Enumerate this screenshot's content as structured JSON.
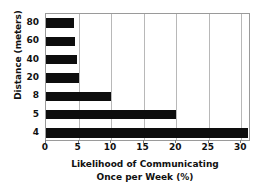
{
  "chart_data": {
    "type": "bar",
    "orientation": "horizontal",
    "title": "",
    "xlabel_line1": "Likelihood of Communicating",
    "xlabel_line2": "Once per Week (%)",
    "ylabel": "Distance (meters)",
    "categories": [
      "80",
      "60",
      "40",
      "20",
      "8",
      "5",
      "4"
    ],
    "values": [
      4.3,
      4.4,
      4.7,
      5.0,
      10.0,
      20.0,
      31.0
    ],
    "xticks": [
      0,
      5,
      10,
      15,
      20,
      25,
      30
    ],
    "xlim": [
      0,
      31.5
    ],
    "grid": "vertical",
    "legend": "none",
    "bar_color": "#0d0d0d",
    "grid_color": "#b8b8b8",
    "frame_color": "#9a9a9a",
    "background_color": "#ffffff"
  }
}
